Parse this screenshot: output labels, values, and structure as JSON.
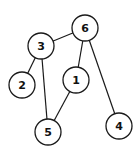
{
  "graph": {
    "type": "undirected",
    "node_radius": 13,
    "nodes": [
      {
        "id": "6",
        "label": "6",
        "x": 85,
        "y": 28
      },
      {
        "id": "3",
        "label": "3",
        "x": 41,
        "y": 46
      },
      {
        "id": "2",
        "label": "2",
        "x": 22,
        "y": 85
      },
      {
        "id": "1",
        "label": "1",
        "x": 76,
        "y": 80
      },
      {
        "id": "5",
        "label": "5",
        "x": 48,
        "y": 132
      },
      {
        "id": "4",
        "label": "4",
        "x": 119,
        "y": 126
      }
    ],
    "edges": [
      {
        "from": "3",
        "to": "6"
      },
      {
        "from": "3",
        "to": "2"
      },
      {
        "from": "3",
        "to": "5"
      },
      {
        "from": "6",
        "to": "1"
      },
      {
        "from": "6",
        "to": "4"
      },
      {
        "from": "1",
        "to": "5"
      }
    ]
  }
}
